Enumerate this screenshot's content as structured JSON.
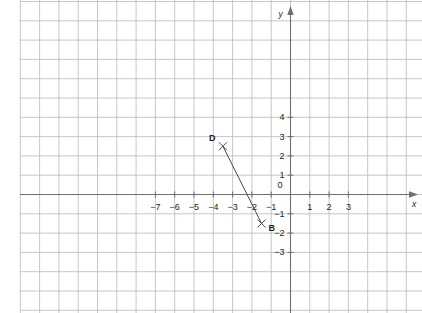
{
  "chart_data": {
    "type": "scatter",
    "title": "",
    "xlabel": "x",
    "ylabel": "y",
    "grid": true,
    "legend": null,
    "xlim": [
      -7.6,
      3.4
    ],
    "ylim": [
      -3.4,
      4.8
    ],
    "xticks": [
      -7,
      -6,
      -5,
      -4,
      -3,
      -2,
      -1,
      0,
      1,
      2,
      3
    ],
    "yticks": [
      -3,
      -2,
      -1,
      1,
      2,
      3,
      4
    ],
    "xtick_labels": [
      "−7",
      "−6",
      "−5",
      "−4",
      "−3",
      "−2",
      "−1",
      "0",
      "1",
      "2",
      "3"
    ],
    "ytick_labels": [
      "−3",
      "−2",
      "−1",
      "1",
      "2",
      "3",
      "4"
    ],
    "origin_label": "0",
    "points": [
      {
        "name": "D",
        "x": -3.5,
        "y": 2.5,
        "marker": "x",
        "label_pos": "left"
      },
      {
        "name": "B",
        "x": -1.5,
        "y": -1.5,
        "marker": "x",
        "label_pos": "right"
      }
    ],
    "segments": [
      {
        "from": "D",
        "to": "B",
        "x1": -3.5,
        "y1": 2.5,
        "x2": -1.5,
        "y2": -1.5
      }
    ],
    "colors": {
      "grid": "#b9b9b9",
      "axis": "#6f6f6f",
      "line": "#4a4a4a",
      "text": "#231f20",
      "background": "#ffffff"
    }
  }
}
